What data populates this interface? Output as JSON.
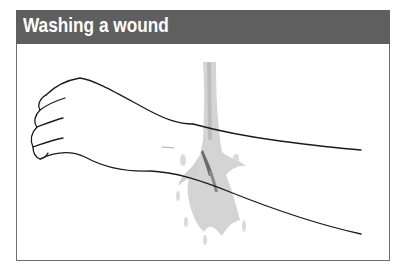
{
  "header": {
    "title": "Washing a wound"
  },
  "illustration": {
    "subject": "forearm-and-hand-under-water-stream",
    "elements": [
      "hand",
      "forearm",
      "water-stream",
      "wound"
    ],
    "colors": {
      "header_bg": "#5f5f5f",
      "title_text": "#ffffff",
      "line": "#1a1a1a",
      "water": "#c8c8c8",
      "wound": "#6a6a6a"
    }
  }
}
